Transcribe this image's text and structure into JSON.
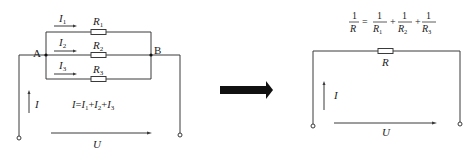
{
  "parallel_circuit": {
    "node_a": "A",
    "node_b": "B",
    "branches": [
      {
        "current": "I",
        "current_sub": "1",
        "resistor": "R",
        "resistor_sub": "1"
      },
      {
        "current": "I",
        "current_sub": "2",
        "resistor": "R",
        "resistor_sub": "2"
      },
      {
        "current": "I",
        "current_sub": "3",
        "resistor": "R",
        "resistor_sub": "3"
      }
    ],
    "total_current": "I",
    "voltage": "U",
    "equation": {
      "lhs": "I",
      "eq": "=",
      "t1": "I",
      "t1_sub": "1",
      "plus1": "+",
      "t2": "I",
      "t2_sub": "2",
      "plus2": "+",
      "t3": "I",
      "t3_sub": "3"
    }
  },
  "transform_arrow": "right-arrow",
  "equivalent_circuit": {
    "resistor": "R",
    "current": "I",
    "voltage": "U",
    "formula": {
      "one": "1",
      "lhs_den": "R",
      "eq": "=",
      "plus": "+",
      "r": "R",
      "subs": [
        "1",
        "2",
        "3"
      ]
    }
  },
  "colors": {
    "wire": "#3a3a3a",
    "arrow_fill": "#111111"
  }
}
